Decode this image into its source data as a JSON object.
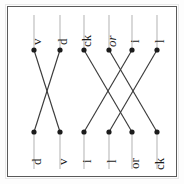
{
  "figure": {
    "orientation_note": "rotated-90-ccw",
    "frame_color": "#5a5a5a",
    "link_color": "#3b3b3b",
    "node_color": "#1c1c1c",
    "stem_color": "#b9b9b9",
    "groups": [
      {
        "id": "group-left",
        "top_labels": [
          {
            "text": "v",
            "italic": false
          },
          {
            "text": "d",
            "italic": false
          }
        ],
        "bottom_labels": [
          {
            "text": "d",
            "italic": false
          },
          {
            "text": "v",
            "italic": false
          }
        ],
        "links": [
          {
            "from": 0,
            "to": 1
          },
          {
            "from": 1,
            "to": 0
          }
        ]
      },
      {
        "id": "group-right",
        "top_labels": [
          {
            "text": "ck",
            "italic": false
          },
          {
            "text": "or",
            "italic": true
          },
          {
            "text": "i",
            "italic": false
          },
          {
            "text": "l",
            "italic": false
          }
        ],
        "bottom_labels": [
          {
            "text": "i",
            "italic": false
          },
          {
            "text": "l",
            "italic": false
          },
          {
            "text": "or",
            "italic": false
          },
          {
            "text": "ck",
            "italic": false
          }
        ],
        "links": [
          {
            "from": 0,
            "to": 2
          },
          {
            "from": 1,
            "to": 3
          },
          {
            "from": 2,
            "to": 0
          },
          {
            "from": 3,
            "to": 1
          }
        ]
      }
    ]
  }
}
